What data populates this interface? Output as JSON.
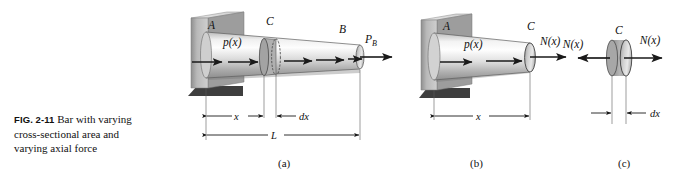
{
  "figure": {
    "caption_number": "FIG. 2-11",
    "caption_text": "Bar with varying cross-sectional area and varying axial force",
    "caption_line1": "Bar with varying",
    "caption_line2": "cross-sectional area and",
    "caption_line3": "varying axial force",
    "background_color": "#ffffff",
    "ink_color": "#111111"
  },
  "panels": [
    {
      "id": "a",
      "label": "(a)",
      "description": "Tapered bar fixed at wall A, loaded by distributed axial load p(x) and end force P_B at B, with cross-section C",
      "labels": {
        "support": "A",
        "distributed_load": "p(x)",
        "section": "C",
        "end": "B",
        "end_force": "P",
        "end_force_sub": "B"
      },
      "dimensions": [
        {
          "name": "x",
          "label": "x"
        },
        {
          "name": "dx",
          "label": "dx"
        },
        {
          "name": "L",
          "label": "L"
        }
      ]
    },
    {
      "id": "b",
      "label": "(b)",
      "description": "Free-body diagram of the left portion of the bar from A to C showing internal axial force N(x)",
      "labels": {
        "support": "A",
        "distributed_load": "p(x)",
        "section": "C",
        "internal_force": "N(x)"
      },
      "dimensions": [
        {
          "name": "x",
          "label": "x"
        }
      ]
    },
    {
      "id": "c",
      "label": "(c)",
      "description": "Differential element of length dx at section C with internal axial force N(x) on both faces",
      "labels": {
        "section": "C",
        "internal_force_left": "N(x)",
        "internal_force_right": "N(x)"
      },
      "dimensions": [
        {
          "name": "dx",
          "label": "dx"
        }
      ]
    }
  ],
  "colors": {
    "bar_light": "#f2f2f2",
    "bar_mid": "#c9c9c9",
    "bar_dark": "#9a9a9a",
    "wall_light": "#d8d8d8",
    "wall_mid": "#b4b4b4",
    "wall_dark": "#6e6e6e",
    "shadow": "#2b2b2b",
    "line": "#1a1a1a"
  }
}
